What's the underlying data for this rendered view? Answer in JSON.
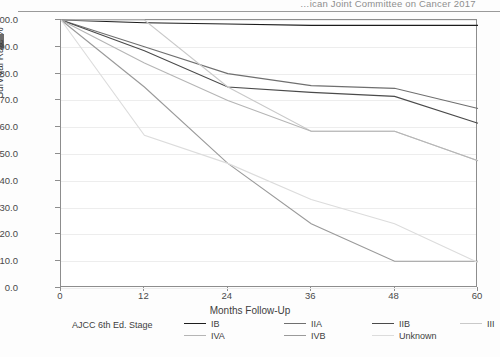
{
  "page_header": "…ican Joint Committee on Cancer   2017",
  "axes": {
    "ylabel": "Survival Rate %",
    "xlabel": "Months Follow-Up",
    "yticks": [
      "100.0",
      "90.0",
      "80.0",
      "70.0",
      "60.0",
      "50.0",
      "40.0",
      "30.0",
      "20.0",
      "10.0",
      "0.0"
    ],
    "xticks": [
      "0",
      "12",
      "24",
      "36",
      "48",
      "60"
    ]
  },
  "legend": {
    "title": "AJCC 6th Ed. Stage",
    "entries": [
      {
        "label": "IB",
        "color": "#1d1d1d"
      },
      {
        "label": "IIA",
        "color": "#6f6f6f"
      },
      {
        "label": "IIB",
        "color": "#4a4a4a"
      },
      {
        "label": "III",
        "color": "#c9c9c9"
      },
      {
        "label": "IVA",
        "color": "#b5b5b5"
      },
      {
        "label": "IVB",
        "color": "#9a9a9a"
      },
      {
        "label": "Unknown",
        "color": "#dcdcdc"
      }
    ]
  },
  "chart_data": {
    "type": "line",
    "title": "",
    "xlabel": "Months Follow-Up",
    "ylabel": "Survival Rate %",
    "xlim": [
      0,
      60
    ],
    "ylim": [
      0,
      100
    ],
    "xticks": [
      0,
      12,
      24,
      36,
      48,
      60
    ],
    "yticks": [
      0,
      10,
      20,
      30,
      40,
      50,
      60,
      70,
      80,
      90,
      100
    ],
    "grid": true,
    "legend_position": "bottom",
    "legend_title": "AJCC 6th Ed. Stage",
    "x": [
      0,
      12,
      24,
      36,
      48,
      60
    ],
    "series": [
      {
        "name": "IB",
        "color": "#1d1d1d",
        "values": [
          100.0,
          99.0,
          98.5,
          98.0,
          98.0,
          98.0
        ]
      },
      {
        "name": "IIA",
        "color": "#6f6f6f",
        "values": [
          100.0,
          90.0,
          80.0,
          75.5,
          74.5,
          67.0
        ]
      },
      {
        "name": "IIB",
        "color": "#4a4a4a",
        "values": [
          100.0,
          88.5,
          75.0,
          73.0,
          71.5,
          61.5
        ]
      },
      {
        "name": "III",
        "color": "#c9c9c9",
        "values": [
          100.0,
          100.0,
          75.0,
          58.5,
          58.5,
          47.5
        ]
      },
      {
        "name": "IVA",
        "color": "#b5b5b5",
        "values": [
          100.0,
          84.0,
          70.0,
          58.5,
          58.5,
          47.5
        ]
      },
      {
        "name": "IVB",
        "color": "#9a9a9a",
        "values": [
          100.0,
          75.0,
          46.5,
          24.0,
          10.0,
          10.0
        ]
      },
      {
        "name": "Unknown",
        "color": "#dcdcdc",
        "values": [
          100.0,
          57.0,
          46.5,
          33.0,
          24.0,
          9.5
        ]
      }
    ]
  }
}
